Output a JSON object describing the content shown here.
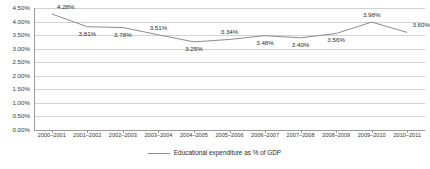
{
  "chart_data": {
    "type": "line",
    "title": "",
    "subtitle": "",
    "xlabel": "",
    "ylabel": "",
    "ylim": [
      0.0,
      4.5
    ],
    "ytick_step": 0.5,
    "grid": true,
    "legend_position": "bottom",
    "value_suffix": "%",
    "categories": [
      "2000–2001",
      "2001–2002",
      "2002–2003",
      "2003–2004",
      "2004–2005",
      "2005–2006",
      "2006–2007",
      "2007–2008",
      "2008–2009",
      "2009–2010",
      "2010–2011"
    ],
    "ytick_labels": [
      "4.50%",
      "4.00%",
      "3.50%",
      "3.00%",
      "2.50%",
      "2.00%",
      "1.50%",
      "1.00%",
      "0.50%",
      "0.00%"
    ],
    "ytick_values": [
      4.5,
      4.0,
      3.5,
      3.0,
      2.5,
      2.0,
      1.5,
      1.0,
      0.5,
      0.0
    ],
    "series": [
      {
        "name": "Educational expenditure as % of GDP",
        "color": "#8c8c8c",
        "values": [
          4.28,
          3.81,
          3.78,
          3.51,
          3.25,
          3.34,
          3.48,
          3.4,
          3.56,
          3.98,
          3.6
        ],
        "point_labels": [
          "4.28%",
          "3.81%",
          "3.78%",
          "3.51%",
          "3.25%",
          "3.34%",
          "3.48%",
          "3.40%",
          "3.56%",
          "3.98%",
          "3.60%"
        ]
      }
    ],
    "legend": [
      {
        "label": "Educational expenditure as % of GDP",
        "color": "#8c8c8c"
      }
    ]
  },
  "colors": {
    "series_line": "#8c8c8c",
    "gridline": "#d2d2d2",
    "axis": "#9a9a9a",
    "text": "#3a3a3a",
    "background": "#ffffff"
  }
}
